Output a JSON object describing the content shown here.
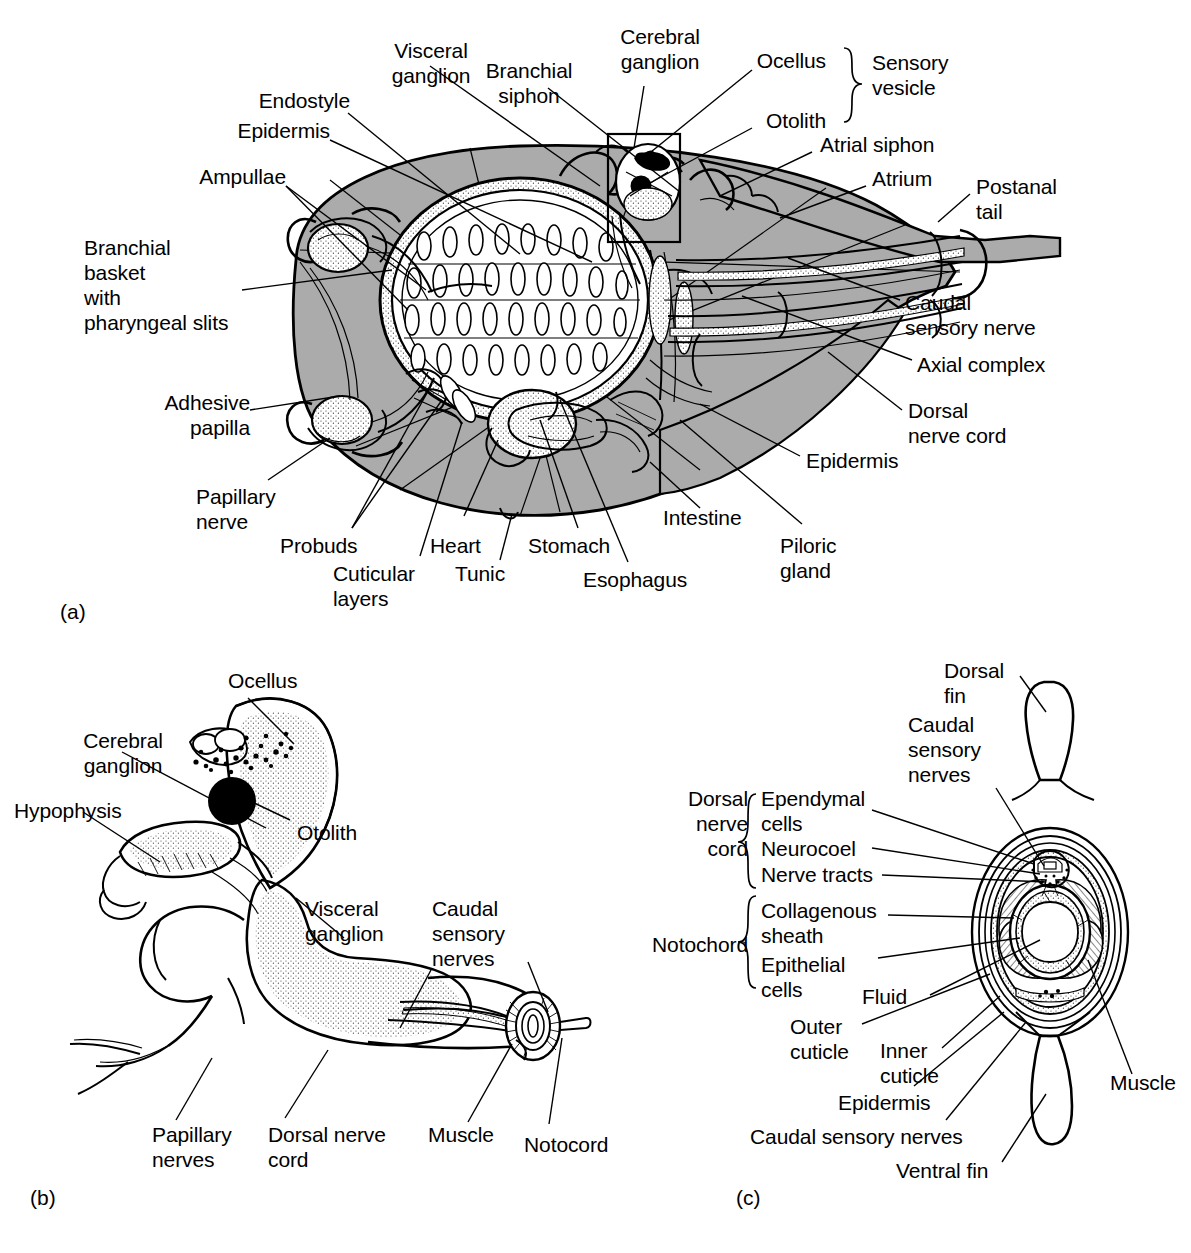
{
  "figure": {
    "colors": {
      "tunic_gray": "#ababab",
      "stipple_gray": "#8f8f8f",
      "line_black": "#000000",
      "background": "#ffffff"
    },
    "panels": [
      {
        "id": "panel-a",
        "caption": "(a)",
        "description": "Whole tadpole larva, lateral view"
      },
      {
        "id": "panel-b",
        "caption": "(b)",
        "description": "Nervous system of the larva"
      },
      {
        "id": "panel-c",
        "caption": "(c)",
        "description": "Transverse section through the tail"
      }
    ]
  },
  "panel_a": {
    "caption": "(a)",
    "labels": [
      {
        "id": "visceral-ganglion",
        "text": "Visceral\nganglion",
        "align": "center"
      },
      {
        "id": "branchial-siphon",
        "text": "Branchial\nsiphon",
        "align": "center"
      },
      {
        "id": "cerebral-ganglion",
        "text": "Cerebral\nganglion",
        "align": "center"
      },
      {
        "id": "ocellus",
        "text": "Ocellus",
        "align": "right"
      },
      {
        "id": "otolith",
        "text": "Otolith",
        "align": "right"
      },
      {
        "id": "sensory-vesicle",
        "text": "Sensory\nvesicle",
        "align": "left"
      },
      {
        "id": "endostyle",
        "text": "Endostyle",
        "align": "right"
      },
      {
        "id": "epidermis-top",
        "text": "Epidermis",
        "align": "right"
      },
      {
        "id": "ampullae",
        "text": "Ampullae",
        "align": "right"
      },
      {
        "id": "atrial-siphon",
        "text": "Atrial siphon",
        "align": "left"
      },
      {
        "id": "atrium",
        "text": "Atrium",
        "align": "left"
      },
      {
        "id": "postanal-tail",
        "text": "Postanal\ntail",
        "align": "left"
      },
      {
        "id": "branchial-basket",
        "text": "Branchial\nbasket\nwith\npharyngeal slits",
        "align": "left"
      },
      {
        "id": "adhesive-papilla",
        "text": "Adhesive\npapilla",
        "align": "right"
      },
      {
        "id": "papillary-nerve",
        "text": "Papillary\nnerve",
        "align": "left"
      },
      {
        "id": "probuds",
        "text": "Probuds",
        "align": "left"
      },
      {
        "id": "cuticular-layers",
        "text": "Cuticular\nlayers",
        "align": "left"
      },
      {
        "id": "heart",
        "text": "Heart",
        "align": "left"
      },
      {
        "id": "tunic",
        "text": "Tunic",
        "align": "left"
      },
      {
        "id": "stomach",
        "text": "Stomach",
        "align": "left"
      },
      {
        "id": "esophagus",
        "text": "Esophagus",
        "align": "left"
      },
      {
        "id": "intestine",
        "text": "Intestine",
        "align": "left"
      },
      {
        "id": "pyloric-gland",
        "text": "Piloric\ngland",
        "align": "left"
      },
      {
        "id": "caudal-sensory-nerve",
        "text": "Caudal\nsensory nerve",
        "align": "left"
      },
      {
        "id": "axial-complex",
        "text": "Axial complex",
        "align": "left"
      },
      {
        "id": "dorsal-nerve-cord",
        "text": "Dorsal\nnerve cord",
        "align": "left"
      },
      {
        "id": "epidermis-right",
        "text": "Epidermis",
        "align": "left"
      }
    ]
  },
  "panel_b": {
    "caption": "(b)",
    "labels": [
      {
        "id": "ocellus-b",
        "text": "Ocellus",
        "align": "left"
      },
      {
        "id": "cerebral-ganglion-b",
        "text": "Cerebral\nganglion",
        "align": "center"
      },
      {
        "id": "hypophysis",
        "text": "Hypophysis",
        "align": "left"
      },
      {
        "id": "otolith-b",
        "text": "Otolith",
        "align": "left"
      },
      {
        "id": "visceral-ganglion-b",
        "text": "Visceral\nganglion",
        "align": "left"
      },
      {
        "id": "caudal-sensory-nerves-b",
        "text": "Caudal\nsensory\nnerves",
        "align": "left"
      },
      {
        "id": "papillary-nerves",
        "text": "Papillary\nnerves",
        "align": "left"
      },
      {
        "id": "dorsal-nerve-cord-b",
        "text": "Dorsal nerve\ncord",
        "align": "left"
      },
      {
        "id": "muscle-b",
        "text": "Muscle",
        "align": "left"
      },
      {
        "id": "notocord-b",
        "text": "Notocord",
        "align": "left"
      }
    ]
  },
  "panel_c": {
    "caption": "(c)",
    "group_labels": [
      {
        "id": "dorsal-nerve-cord-group",
        "text": "Dorsal\nnerve\ncord",
        "members": [
          "Ependymal cells",
          "Neurocoel",
          "Nerve tracts"
        ]
      },
      {
        "id": "notochord-group",
        "text": "Notochord",
        "members": [
          "Collagenous sheath",
          "Epithelial cells"
        ]
      }
    ],
    "labels": [
      {
        "id": "dorsal-fin",
        "text": "Dorsal\nfin",
        "align": "left"
      },
      {
        "id": "caudal-sensory-nerves-c",
        "text": "Caudal\nsensory\nnerves",
        "align": "left"
      },
      {
        "id": "dorsal-nerve-cord-c",
        "text": "Dorsal\nnerve\ncord",
        "align": "right"
      },
      {
        "id": "ependymal-cells",
        "text": "Ependymal\ncells",
        "align": "left"
      },
      {
        "id": "neurocoel",
        "text": "Neurocoel",
        "align": "left"
      },
      {
        "id": "nerve-tracts",
        "text": "Nerve tracts",
        "align": "left"
      },
      {
        "id": "notochord-c",
        "text": "Notochord",
        "align": "right"
      },
      {
        "id": "collagenous-sheath",
        "text": "Collagenous\nsheath",
        "align": "left"
      },
      {
        "id": "epithelial-cells",
        "text": "Epithelial\ncells",
        "align": "left"
      },
      {
        "id": "fluid",
        "text": "Fluid",
        "align": "left"
      },
      {
        "id": "outer-cuticle",
        "text": "Outer\ncuticle",
        "align": "left"
      },
      {
        "id": "inner-cuticle",
        "text": "Inner\ncuticle",
        "align": "left"
      },
      {
        "id": "epidermis-c",
        "text": "Epidermis",
        "align": "left"
      },
      {
        "id": "caudal-sensory-nerves-c2",
        "text": "Caudal sensory nerves",
        "align": "left"
      },
      {
        "id": "ventral-fin",
        "text": "Ventral fin",
        "align": "left"
      },
      {
        "id": "muscle-c",
        "text": "Muscle",
        "align": "left"
      }
    ]
  }
}
